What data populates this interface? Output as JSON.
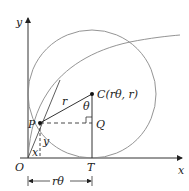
{
  "diagram": {
    "type": "cycloid-construction",
    "labels": {
      "y_axis": "y",
      "x_axis": "x",
      "origin": "O",
      "point_p": "P",
      "point_c": "C(rθ, r)",
      "point_q": "Q",
      "point_t": "T",
      "radius": "r",
      "angle": "θ",
      "len_x": "x",
      "len_y": "y",
      "arc_length": "rθ"
    },
    "colors": {
      "stroke": "#333333",
      "curve": "#888888"
    }
  }
}
